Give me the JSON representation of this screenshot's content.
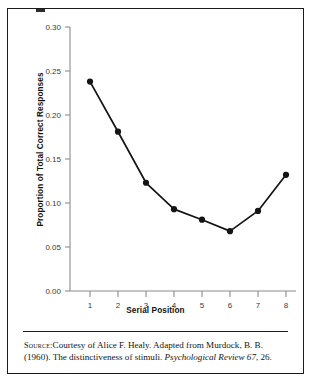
{
  "chart_data": {
    "type": "line",
    "title": "",
    "xlabel": "Serial Position",
    "ylabel": "Proportion of Total Correct Responses",
    "x": [
      1,
      2,
      3,
      4,
      5,
      6,
      7,
      8
    ],
    "categories": [
      "1",
      "2",
      "3",
      "4",
      "5",
      "6",
      "7",
      "8"
    ],
    "values": [
      0.238,
      0.181,
      0.123,
      0.093,
      0.081,
      0.068,
      0.091,
      0.132
    ],
    "series": [
      {
        "name": "Proportion of Total Correct Responses",
        "values": [
          0.238,
          0.181,
          0.123,
          0.093,
          0.081,
          0.068,
          0.091,
          0.132
        ]
      }
    ],
    "xlim": [
      0.5,
      8.5
    ],
    "ylim": [
      0.0,
      0.3
    ],
    "ytick_labels": [
      "0.00",
      "0.05",
      "0.10",
      "0.15",
      "0.20",
      "0.25",
      "0.30"
    ],
    "ytick_values": [
      0.0,
      0.05,
      0.1,
      0.15,
      0.2,
      0.25,
      0.3
    ],
    "xtick_labels": [
      "1",
      "2",
      "3",
      "4",
      "5",
      "6",
      "7",
      "8"
    ],
    "grid": false,
    "legend": false,
    "marker": "filled-circle",
    "line_color": "#141414",
    "marker_color": "#141414",
    "axis_color": "#8c8c8c"
  },
  "caption": {
    "source_label": "Source:",
    "text_part1": "Courtesy of Alice F. Healy. Adapted from Murdock, B. B. (1960). The distinctiveness of stimuli. ",
    "journal_italic": "Psychological Review 67",
    "text_part2": ", 26."
  }
}
